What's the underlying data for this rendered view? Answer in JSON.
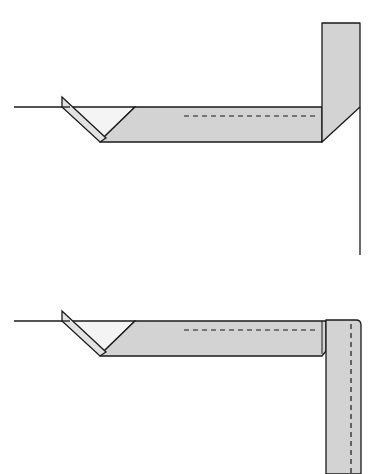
{
  "colors": {
    "background": "#ffffff",
    "paper_face": "#fdfdfd",
    "paper_colored": "#d3d3d3",
    "paper_light": "#efefef",
    "outline": "#1a1a1a"
  },
  "diagrams": [
    {
      "id": "step-a",
      "description": "Strip folded diagonally at left; vertical strip standing up at right corner; dashed valley-fold line on horizontal strip"
    },
    {
      "id": "step-b",
      "description": "Right strip folded down vertically along right edge; dashed fold lines on horizontal and vertical strips"
    }
  ]
}
